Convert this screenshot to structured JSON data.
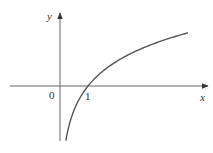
{
  "chart_data": {
    "type": "line",
    "title": "",
    "function": "y = ln x",
    "xlabel": "x",
    "ylabel": "y",
    "x_ticks": [
      {
        "value": 0,
        "label": "0"
      },
      {
        "value": 1,
        "label": "1"
      }
    ],
    "series": [
      {
        "name": "curve",
        "x": [
          0.21,
          0.3,
          0.5,
          0.75,
          1,
          1.5,
          2,
          2.5,
          3,
          3.5,
          4,
          4.57
        ],
        "values": [
          -1.56,
          -1.2,
          -0.69,
          -0.29,
          0,
          0.41,
          0.69,
          0.92,
          1.1,
          1.25,
          1.39,
          1.52
        ]
      }
    ],
    "xlim": [
      -1.8,
      5.3
    ],
    "ylim": [
      -1.6,
      2.1
    ],
    "grid": false,
    "legend": null,
    "annotations": [
      "Curve crosses x-axis at x = 1"
    ]
  },
  "labels": {
    "x_axis": "x",
    "y_axis": "y",
    "origin": "0",
    "one": "1"
  },
  "colors": {
    "axis": "#555555",
    "curve": "#555555"
  }
}
